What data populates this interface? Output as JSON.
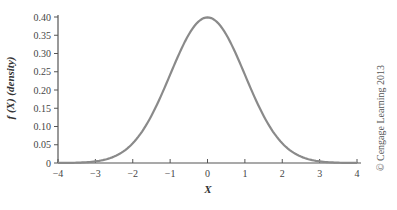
{
  "chart_data": {
    "type": "line",
    "title": "",
    "xlabel": "X",
    "ylabel": "f (X) (density)",
    "xlim": [
      -4,
      4
    ],
    "ylim": [
      0,
      0.4
    ],
    "grid": false,
    "legend": null,
    "x_ticks": [
      "−4",
      "−3",
      "−2",
      "−1",
      "0",
      "1",
      "2",
      "3",
      "4"
    ],
    "y_ticks": [
      "0",
      "0.05",
      "0.10",
      "0.15",
      "0.20",
      "0.25",
      "0.30",
      "0.35",
      "0.40"
    ],
    "series": [
      {
        "name": "Standard normal density",
        "x": [
          -4,
          -3.5,
          -3,
          -2.5,
          -2,
          -1.5,
          -1,
          -0.5,
          0,
          0.5,
          1,
          1.5,
          2,
          2.5,
          3,
          3.5,
          4
        ],
        "values": [
          0.0001,
          0.0009,
          0.0044,
          0.0175,
          0.054,
          0.1295,
          0.242,
          0.3521,
          0.3989,
          0.3521,
          0.242,
          0.1295,
          0.054,
          0.0175,
          0.0044,
          0.0009,
          0.0001
        ]
      }
    ],
    "line_color": "#8a8a8a",
    "annotations": [
      "© Cengage Learning 2013"
    ]
  },
  "labels": {
    "ylabel": "f (X) (density)",
    "xlabel": "X",
    "credit": "© Cengage Learning 2013"
  }
}
